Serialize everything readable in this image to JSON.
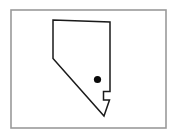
{
  "figure": {
    "kind": "state-outline-map",
    "region_name": "Nevada",
    "background_color": "#ffffff",
    "frame": {
      "name": "border",
      "x": 11,
      "y": 10,
      "width": 155,
      "height": 118,
      "stroke_color": "#9a9a9a",
      "stroke_width": 1.6,
      "fill_color": "#ffffff"
    },
    "outline": {
      "name": "state-boundary",
      "stroke_color": "#1a1a1a",
      "stroke_width": 1.5,
      "fill_color": "#ffffff",
      "points": "53,20 110,22 110,91.5 103.5,91.5 103.5,100 109.5,100 104,116 53,58.5",
      "vertices": [
        [
          53,
          20
        ],
        [
          110,
          22
        ],
        [
          110,
          91.5
        ],
        [
          103.5,
          91.5
        ],
        [
          103.5,
          100
        ],
        [
          109.5,
          100
        ],
        [
          104,
          116
        ],
        [
          53,
          58.5
        ]
      ]
    },
    "markers": [
      {
        "name": "city-dot",
        "label": "",
        "cx": 97.5,
        "cy": 79.5,
        "r": 3.6,
        "color": "#0a0a0a"
      }
    ]
  }
}
